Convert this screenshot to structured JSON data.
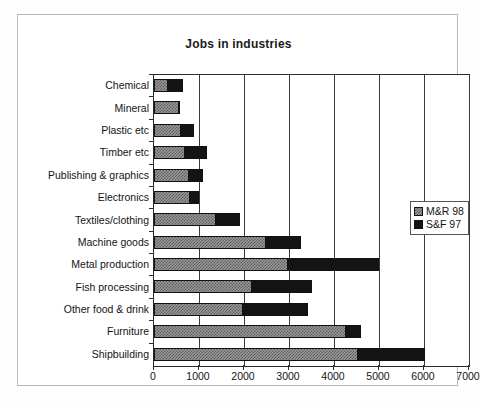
{
  "chart_data": {
    "type": "bar",
    "orientation": "horizontal",
    "stacked": true,
    "title": "Jobs in industries",
    "xlabel": "",
    "ylabel": "",
    "xlim": [
      0,
      7000
    ],
    "xticks": [
      0,
      1000,
      2000,
      3000,
      4000,
      5000,
      6000,
      7000
    ],
    "xticklabels": [
      "0",
      "1000",
      "2000",
      "3000",
      "4000",
      "5000",
      "6000",
      "7000"
    ],
    "grid": "vertical",
    "legend_position": "right",
    "categories": [
      "Chemical",
      "Mineral",
      "Plastic etc",
      "Timber etc",
      "Publishing & graphics",
      "Electronics",
      "Textiles/clothing",
      "Machine goods",
      "Metal production",
      "Fish processing",
      "Other food & drink",
      "Furniture",
      "Shipbuilding"
    ],
    "series": [
      {
        "name": "M&R 98",
        "fill": "checkered-gray",
        "color": "#9a9a9a",
        "values": [
          290,
          540,
          570,
          660,
          760,
          780,
          1350,
          2470,
          2960,
          2150,
          1950,
          4250,
          4500
        ]
      },
      {
        "name": "S&F 97",
        "fill": "solid-black",
        "color": "#141414",
        "values": [
          350,
          30,
          330,
          520,
          330,
          230,
          550,
          800,
          2040,
          1350,
          1470,
          350,
          1530
        ]
      }
    ],
    "totals": [
      640,
      570,
      900,
      1180,
      1090,
      1010,
      1900,
      3270,
      5000,
      3500,
      3420,
      4600,
      6030
    ]
  },
  "legend": {
    "items": [
      {
        "label": "M&R 98",
        "swatch": "checkered-gray-swatch"
      },
      {
        "label": "S&F 97",
        "swatch": "solid-black-swatch"
      }
    ]
  }
}
